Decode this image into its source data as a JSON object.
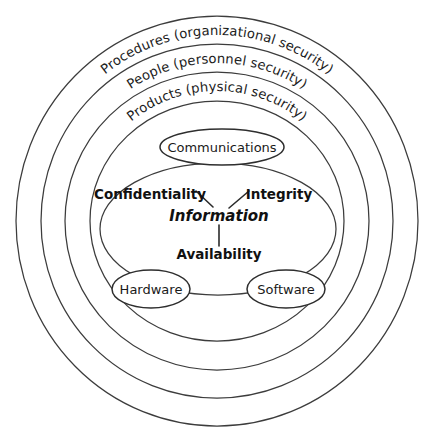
{
  "diagram": {
    "background_color": "#ffffff",
    "line_color": "#3c3c3c",
    "text_color": "#111111",
    "rings": [
      {
        "index": 1,
        "name": "procedures-ring",
        "label": "Procedures (organizational security)",
        "rx": 201,
        "ry": 205,
        "label_radius_rx": 182,
        "label_radius_ry": 186
      },
      {
        "index": 2,
        "name": "people-ring",
        "label": "People (personnel security)",
        "rx": 176,
        "ry": 177,
        "label_radius_rx": 157,
        "label_radius_ry": 158
      },
      {
        "index": 3,
        "name": "products-ring",
        "label": "Products (physical security)",
        "rx": 152,
        "ry": 149,
        "label_radius_rx": 133,
        "label_radius_ry": 130
      },
      {
        "index": 4,
        "name": "inner-ring",
        "label": "",
        "rx": 127,
        "ry": 120,
        "label_radius_rx": 0,
        "label_radius_ry": 0
      }
    ],
    "center": {
      "cx": 217,
      "cy": 221
    },
    "nodes": [
      {
        "name": "communications-node",
        "label": "Communications",
        "cx": 222,
        "cy": 147,
        "rx": 62,
        "ry": 18
      },
      {
        "name": "information-core-ellipse",
        "label": "",
        "cx": 218,
        "cy": 229,
        "rx": 118,
        "ry": 66
      },
      {
        "name": "hardware-node",
        "label": "Hardware",
        "cx": 151,
        "cy": 289,
        "rx": 39,
        "ry": 19
      },
      {
        "name": "software-node",
        "label": "Software",
        "cx": 286,
        "cy": 289,
        "rx": 39,
        "ry": 19
      }
    ],
    "core": {
      "name": "information",
      "label": "Information",
      "x": 219,
      "y": 216
    },
    "triad": [
      {
        "name": "confidentiality",
        "label": "Confidentiality",
        "x": 150,
        "y": 195
      },
      {
        "name": "integrity",
        "label": "Integrity",
        "x": 279,
        "y": 195
      },
      {
        "name": "availability",
        "label": "Availability",
        "x": 219,
        "y": 255
      }
    ],
    "connectors": [
      {
        "name": "confidentiality-to-information",
        "x1": 196,
        "y1": 191,
        "x2": 213,
        "y2": 207
      },
      {
        "name": "integrity-to-information",
        "x1": 249,
        "y1": 191,
        "x2": 229,
        "y2": 208
      },
      {
        "name": "information-to-availability",
        "x1": 219,
        "y1": 225,
        "x2": 219,
        "y2": 246
      }
    ]
  }
}
